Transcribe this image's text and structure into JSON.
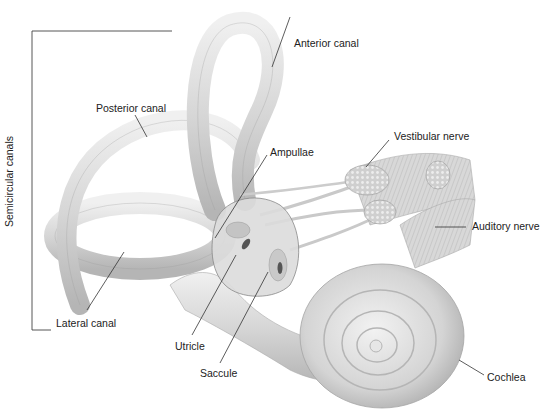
{
  "diagram": {
    "group_label": "Semicircular canals",
    "labels": {
      "anterior_canal": "Anterior canal",
      "posterior_canal": "Posterior canal",
      "lateral_canal": "Lateral canal",
      "ampullae": "Ampullae",
      "vestibular_nerve": "Vestibular nerve",
      "auditory_nerve": "Auditory nerve",
      "utricle": "Utricle",
      "saccule": "Saccule",
      "cochlea": "Cochlea"
    },
    "colors": {
      "background": "#ffffff",
      "structure_fill": "#d9d9d9",
      "structure_light": "#ececec",
      "structure_shade": "#a8a8a8",
      "leader_line": "#333333",
      "text": "#222222"
    }
  }
}
